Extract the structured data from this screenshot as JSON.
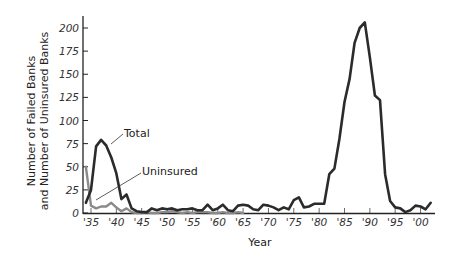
{
  "chart_data": {
    "type": "line",
    "title": "",
    "xlabel": "Year",
    "ylabel": [
      "Number of Failed Banks",
      "and Number of Uninsured Banks"
    ],
    "ylim": [
      0,
      210
    ],
    "xlim": [
      1934,
      2002
    ],
    "y_ticks": [
      0,
      25,
      50,
      75,
      100,
      125,
      150,
      175,
      200
    ],
    "x_ticks": [
      {
        "year": 1935,
        "label": "'35"
      },
      {
        "year": 1940,
        "label": "'40"
      },
      {
        "year": 1945,
        "label": "'45"
      },
      {
        "year": 1950,
        "label": "'50"
      },
      {
        "year": 1955,
        "label": "'55"
      },
      {
        "year": 1960,
        "label": "'60"
      },
      {
        "year": 1965,
        "label": "'65"
      },
      {
        "year": 1970,
        "label": "'70"
      },
      {
        "year": 1975,
        "label": "'75"
      },
      {
        "year": 1980,
        "label": "'80"
      },
      {
        "year": 1985,
        "label": "'85"
      },
      {
        "year": 1990,
        "label": "'90"
      },
      {
        "year": 1995,
        "label": "'95"
      },
      {
        "year": 2000,
        "label": "'00"
      }
    ],
    "grid": false,
    "series": [
      {
        "name": "Total",
        "color": "#2b2b2b",
        "x": [
          1934,
          1935,
          1936,
          1937,
          1938,
          1939,
          1940,
          1941,
          1942,
          1943,
          1944,
          1945,
          1946,
          1947,
          1948,
          1949,
          1950,
          1951,
          1952,
          1953,
          1954,
          1955,
          1956,
          1957,
          1958,
          1959,
          1960,
          1961,
          1962,
          1963,
          1964,
          1965,
          1966,
          1967,
          1968,
          1969,
          1970,
          1971,
          1972,
          1973,
          1974,
          1975,
          1976,
          1977,
          1978,
          1979,
          1980,
          1981,
          1982,
          1983,
          1984,
          1985,
          1986,
          1987,
          1988,
          1989,
          1990,
          1991,
          1992,
          1993,
          1994,
          1995,
          1996,
          1997,
          1998,
          1999,
          2000,
          2001,
          2002
        ],
        "values": [
          11,
          25,
          72,
          79,
          73,
          60,
          43,
          15,
          20,
          5,
          2,
          1,
          1,
          5,
          3,
          5,
          4,
          5,
          3,
          4,
          4,
          5,
          3,
          3,
          9,
          3,
          5,
          9,
          3,
          2,
          8,
          9,
          8,
          4,
          3,
          9,
          8,
          6,
          3,
          6,
          4,
          14,
          17,
          6,
          7,
          10,
          10,
          10,
          42,
          48,
          80,
          120,
          145,
          184,
          200,
          206,
          168,
          127,
          122,
          42,
          13,
          6,
          5,
          1,
          3,
          8,
          7,
          4,
          11
        ]
      },
      {
        "name": "Uninsured",
        "color": "#8a8a8a",
        "x": [
          1934,
          1935,
          1936,
          1937,
          1938,
          1939,
          1940,
          1941,
          1942,
          1943,
          1944,
          1945,
          1946,
          1947,
          1948,
          1949,
          1950,
          1951,
          1952,
          1953,
          1954,
          1955,
          1956,
          1957,
          1958,
          1959,
          1960,
          1961,
          1962,
          1963,
          1964,
          1965
        ],
        "values": [
          50,
          8,
          5,
          7,
          7,
          11,
          6,
          2,
          5,
          1,
          0,
          0,
          1,
          0,
          0,
          1,
          1,
          2,
          1,
          0,
          1,
          0,
          1,
          1,
          1,
          0,
          0,
          1,
          0,
          0,
          1,
          0
        ]
      }
    ],
    "annotations": [
      {
        "text": "Total",
        "points_to_year": 1937
      },
      {
        "text": "Uninsured",
        "points_to_year": 1935
      }
    ]
  }
}
